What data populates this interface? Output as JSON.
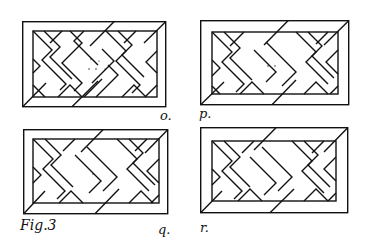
{
  "figure": {
    "caption": "Fig.3",
    "ink_color": "#111111",
    "paper_color": "#ffffff"
  },
  "panels": [
    {
      "id": "o",
      "label": "o.",
      "x": 22,
      "y": 21,
      "w": 144,
      "h": 86,
      "label_x": 160,
      "label_y": 110,
      "dots": 5
    },
    {
      "id": "p",
      "label": "p.",
      "x": 200,
      "y": 20,
      "w": 149,
      "h": 85,
      "label_x": 199,
      "label_y": 108,
      "dots": 2
    },
    {
      "id": "q",
      "label": "q.",
      "x": 23,
      "y": 129,
      "w": 145,
      "h": 85,
      "label_x": 158,
      "label_y": 224,
      "dots": 1
    },
    {
      "id": "r",
      "label": "r.",
      "x": 200,
      "y": 127,
      "w": 148,
      "h": 86,
      "label_x": 200,
      "label_y": 222,
      "dots": 0
    }
  ]
}
